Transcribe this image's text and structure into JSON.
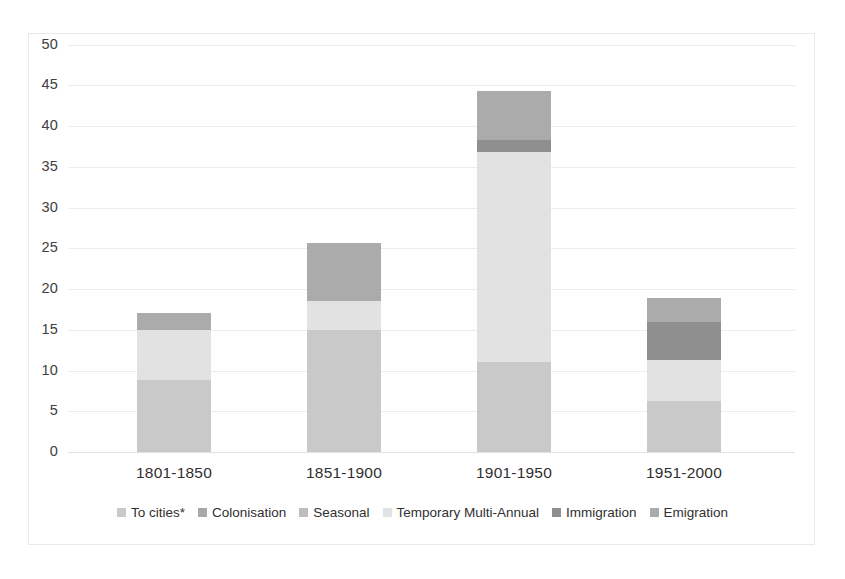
{
  "chart_data": {
    "type": "bar",
    "subtype": "stacked-bar",
    "title": "",
    "xlabel": "",
    "ylabel": "",
    "ylim": [
      0,
      50
    ],
    "ytick_step": 5,
    "yticks": [
      "50",
      "45",
      "40",
      "35",
      "30",
      "25",
      "20",
      "15",
      "10",
      "5",
      "0"
    ],
    "grid": true,
    "legend_position": "bottom",
    "categories": [
      "1801-1850",
      "1851-1900",
      "1901-1950",
      "1951-2000"
    ],
    "series": [
      {
        "name": "To cities*",
        "color": "#c9c9c9",
        "values": [
          8.8,
          15.0,
          11.0,
          6.3
        ]
      },
      {
        "name": "Colonisation",
        "color": "#a8a8a8",
        "values": [
          0,
          0,
          0,
          0
        ]
      },
      {
        "name": "Seasonal",
        "color": "#bdbdbd",
        "values": [
          0,
          0,
          0,
          0
        ]
      },
      {
        "name": "Temporary Multi-Annual",
        "color": "#e2e2e2",
        "values": [
          6.2,
          3.5,
          25.8,
          5.0
        ]
      },
      {
        "name": "Immigration",
        "color": "#8f8f8f",
        "values": [
          0,
          0,
          1.5,
          4.6
        ]
      },
      {
        "name": "Emigration",
        "color": "#ababab",
        "values": [
          2.0,
          7.1,
          6.0,
          3.0
        ]
      }
    ],
    "totals": [
      17.0,
      25.6,
      44.3,
      18.9
    ],
    "footnote_marker": "*"
  },
  "legend": {
    "items": [
      {
        "label": "To cities*",
        "color": "#c9c9c9"
      },
      {
        "label": "Colonisation",
        "color": "#a8a8a8"
      },
      {
        "label": "Seasonal",
        "color": "#bdbdbd"
      },
      {
        "label": "Temporary Multi-Annual",
        "color": "#e2e2e2"
      },
      {
        "label": "Immigration",
        "color": "#8f8f8f"
      },
      {
        "label": "Emigration",
        "color": "#ababab"
      }
    ]
  }
}
